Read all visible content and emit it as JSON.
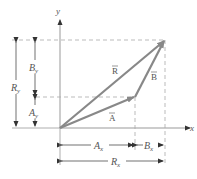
{
  "axes": {
    "x_label": "x",
    "y_label": "y"
  },
  "vectors": [
    {
      "name": "A",
      "label": "A⃗",
      "display": "A",
      "color": "#888888"
    },
    {
      "name": "B",
      "label": "B⃗",
      "display": "B",
      "color": "#888888"
    },
    {
      "name": "R",
      "label": "R⃗",
      "display": "R",
      "color": "#888888"
    }
  ],
  "components": {
    "Ax": {
      "main": "A",
      "sub": "x"
    },
    "Bx": {
      "main": "B",
      "sub": "x"
    },
    "Rx": {
      "main": "R",
      "sub": "x"
    },
    "Ay": {
      "main": "A",
      "sub": "y"
    },
    "By": {
      "main": "B",
      "sub": "y"
    },
    "Ry": {
      "main": "R",
      "sub": "y"
    }
  },
  "vector_glyphs": {
    "A": "A",
    "B": "B",
    "R": "R",
    "arrow": "→"
  }
}
